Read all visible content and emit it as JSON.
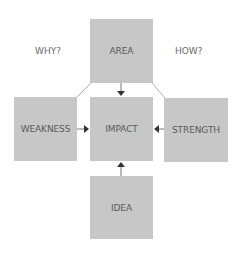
{
  "diagram": {
    "boxes": {
      "area": "AREA",
      "weakness": "WEAKNESS",
      "impact": "IMPACT",
      "strength": "STRENGTH",
      "idea": "IDEA"
    },
    "side_labels": {
      "why": "WHY?",
      "how": "HOW?"
    },
    "colors": {
      "box_fill": "#c7c7c7",
      "text": "#5a5a5a",
      "connector": "#8a8a8a",
      "arrowhead": "#3a3a3a"
    },
    "edges": [
      {
        "from": "AREA",
        "to": "IMPACT"
      },
      {
        "from": "WEAKNESS",
        "to": "IMPACT"
      },
      {
        "from": "STRENGTH",
        "to": "IMPACT"
      },
      {
        "from": "IDEA",
        "to": "IMPACT"
      }
    ]
  }
}
